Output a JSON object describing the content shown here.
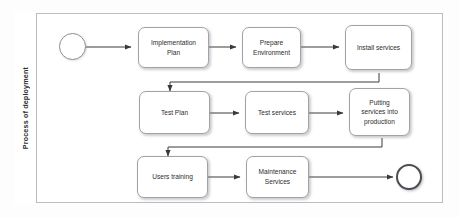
{
  "diagram": {
    "type": "bpmn-process-flow",
    "lane": {
      "label": "Process of deployment"
    },
    "events": [
      {
        "id": "start",
        "name": "start-event",
        "kind": "start"
      },
      {
        "id": "end",
        "name": "end-event",
        "kind": "end"
      }
    ],
    "tasks": [
      {
        "id": "t1",
        "label": "Implementation\nPlan"
      },
      {
        "id": "t2",
        "label": "Prepare\nEnvironment"
      },
      {
        "id": "t3",
        "label": "Install services"
      },
      {
        "id": "t4",
        "label": "Test Plan"
      },
      {
        "id": "t5",
        "label": "Test services"
      },
      {
        "id": "t6",
        "label": "Putting\nservices into\nproduction"
      },
      {
        "id": "t7",
        "label": "Users training"
      },
      {
        "id": "t8",
        "label": "Maintenance\nServices"
      }
    ],
    "flows": [
      {
        "from": "start",
        "to": "t1"
      },
      {
        "from": "t1",
        "to": "t2"
      },
      {
        "from": "t2",
        "to": "t3"
      },
      {
        "from": "t3",
        "to": "t4"
      },
      {
        "from": "t4",
        "to": "t5"
      },
      {
        "from": "t5",
        "to": "t6"
      },
      {
        "from": "t6",
        "to": "t7"
      },
      {
        "from": "t7",
        "to": "t8"
      },
      {
        "from": "t8",
        "to": "end"
      }
    ],
    "colors": {
      "frame_border": "#b9bcc0",
      "task_border": "#9fa3a8",
      "task_fill": "#ffffff",
      "connector": "#3a3a3a",
      "end_event_border": "#4a4d51",
      "text": "#2d2d2d"
    }
  }
}
